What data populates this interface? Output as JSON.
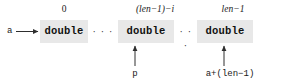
{
  "figure": {
    "type": "memory-layout-diagram",
    "colors": {
      "cell_fill": "#e8e8e8",
      "text": "#111111",
      "arrow": "#333333",
      "background": "#ffffff"
    }
  },
  "index_labels": {
    "first": "0",
    "middle": "(len−1)−i",
    "last": "len−1"
  },
  "cells": [
    {
      "id": "cell-first",
      "type_name": "double"
    },
    {
      "id": "cell-middle",
      "type_name": "double"
    },
    {
      "id": "cell-last",
      "type_name": "double"
    }
  ],
  "ellipses": {
    "left": "· · ·",
    "right": "· · ·"
  },
  "pointers": {
    "base": "a",
    "middle": "p",
    "end": "a+(len−1)"
  }
}
